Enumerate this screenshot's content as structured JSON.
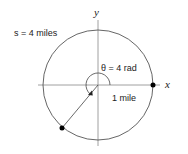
{
  "diagram": {
    "axis_x_label": "x",
    "axis_y_label": "y",
    "arc_length_label": "s = 4 miles",
    "angle_label": "θ = 4 rad",
    "radius_label": "1 mile",
    "circle": {
      "center": [
        98,
        85
      ],
      "radius": 55
    },
    "angle_radians": 4,
    "points": [
      {
        "name": "start-point",
        "coords": [
          153,
          85
        ]
      },
      {
        "name": "end-point",
        "coords": [
          62,
          128
        ]
      }
    ],
    "colors": {
      "stroke": "#555555",
      "axis": "#888888",
      "point": "#000000"
    }
  }
}
